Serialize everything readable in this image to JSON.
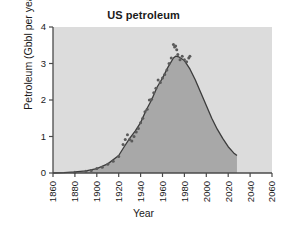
{
  "chart_data": {
    "type": "area",
    "title": "US petroleum",
    "xlabel": "Year",
    "ylabel": "Petroleum (Gbbl per year)",
    "xlim": [
      1860,
      2060
    ],
    "ylim": [
      0,
      4
    ],
    "xticks": [
      1860,
      1880,
      1900,
      1920,
      1940,
      1960,
      1980,
      2000,
      2020,
      2040,
      2060
    ],
    "yticks": [
      0,
      1,
      2,
      3,
      4
    ],
    "grid": false,
    "legend_position": "inside-top-right",
    "annotations": [
      {
        "text": "US production",
        "x": 2000,
        "y": 3.6
      }
    ],
    "series": [
      {
        "name": "US production",
        "kind": "line",
        "fill": true,
        "x": [
          1860,
          1870,
          1880,
          1890,
          1900,
          1910,
          1920,
          1925,
          1930,
          1935,
          1940,
          1945,
          1950,
          1955,
          1960,
          1965,
          1970,
          1972,
          1975,
          1980,
          1985,
          1990,
          1995,
          2000,
          2005,
          2010,
          2015,
          2020,
          2025,
          2028
        ],
        "values": [
          0.0,
          0.01,
          0.03,
          0.06,
          0.12,
          0.25,
          0.48,
          0.72,
          0.95,
          1.15,
          1.38,
          1.72,
          2.0,
          2.35,
          2.6,
          2.9,
          3.15,
          3.2,
          3.18,
          3.08,
          2.85,
          2.55,
          2.2,
          1.85,
          1.5,
          1.2,
          0.95,
          0.72,
          0.55,
          0.48
        ]
      },
      {
        "name": "US production (annual data)",
        "kind": "scatter",
        "x": [
          1880,
          1890,
          1895,
          1900,
          1905,
          1910,
          1915,
          1920,
          1924,
          1926,
          1928,
          1930,
          1932,
          1934,
          1936,
          1938,
          1940,
          1942,
          1944,
          1946,
          1948,
          1950,
          1952,
          1954,
          1956,
          1958,
          1960,
          1962,
          1964,
          1966,
          1968,
          1970,
          1971,
          1972,
          1973,
          1974,
          1976,
          1978,
          1980,
          1982,
          1984,
          1985
        ],
        "values": [
          0.02,
          0.05,
          0.07,
          0.12,
          0.16,
          0.24,
          0.32,
          0.45,
          0.78,
          0.92,
          1.05,
          0.92,
          0.88,
          1.0,
          1.12,
          1.22,
          1.38,
          1.5,
          1.68,
          1.75,
          2.0,
          2.02,
          2.2,
          2.32,
          2.55,
          2.48,
          2.6,
          2.7,
          2.82,
          3.0,
          3.15,
          3.52,
          3.45,
          3.48,
          3.38,
          3.25,
          3.1,
          3.2,
          3.1,
          3.05,
          3.15,
          3.2
        ]
      }
    ],
    "colors": {
      "panel": "#dcdcdc",
      "fill": "#a8a8a8",
      "line": "#3c3c3c",
      "points": "#5a5a5a",
      "axis": "#4a4a4a"
    }
  }
}
